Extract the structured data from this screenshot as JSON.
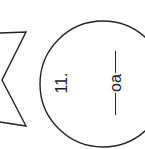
{
  "item": {
    "number": "11.",
    "blank_prefix": "",
    "blank_text": "oa",
    "blank_suffix": ""
  },
  "shapes": {
    "circle": {
      "cx": 103,
      "cy": 84,
      "r": 63,
      "stroke": "#222222"
    },
    "star_fragment": {
      "points": "0,33 26,32 2,80 26,126 0,122",
      "stroke": "#222222"
    }
  }
}
